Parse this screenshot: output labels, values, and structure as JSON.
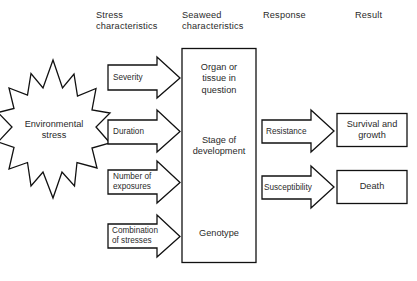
{
  "figure": {
    "background_color": "#ffffff",
    "stroke_color": "#111111",
    "text_color": "#2a2a2a"
  },
  "column_headers": [
    {
      "id": "stress-characteristics",
      "label": "Stress\ncharacteristics"
    },
    {
      "id": "seaweed-characteristics",
      "label": "Seaweed\ncharacteristics"
    },
    {
      "id": "response",
      "label": "Response"
    },
    {
      "id": "result",
      "label": "Result"
    }
  ],
  "source": {
    "id": "environmental-stress",
    "shape": "starburst",
    "label": "Environmental\nstress"
  },
  "stress_arrows": [
    {
      "id": "severity",
      "label": "Severity"
    },
    {
      "id": "duration",
      "label": "Duration"
    },
    {
      "id": "number-of-exposures",
      "label": "Number of\nexposures"
    },
    {
      "id": "combination-of-stresses",
      "label": "Combination\nof stresses"
    }
  ],
  "seaweed_box": {
    "id": "seaweed-characteristics-box",
    "entries": [
      {
        "id": "organ-or-tissue",
        "label": "Organ or\ntissue in\nquestion"
      },
      {
        "id": "stage-of-development",
        "label": "Stage of\ndevelopment"
      },
      {
        "id": "genotype",
        "label": "Genotype"
      }
    ]
  },
  "response_arrows": [
    {
      "id": "resistance",
      "label": "Resistance"
    },
    {
      "id": "susceptibility",
      "label": "Susceptibility"
    }
  ],
  "result_boxes": [
    {
      "id": "survival-and-growth",
      "label": "Survival and\ngrowth"
    },
    {
      "id": "death",
      "label": "Death"
    }
  ]
}
